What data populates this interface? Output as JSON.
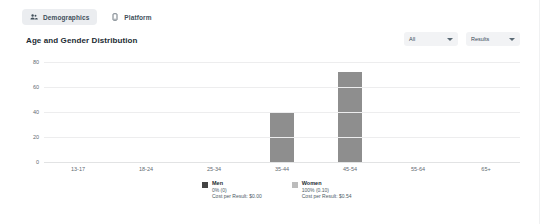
{
  "tabs": [
    {
      "label": "Demographics",
      "icon": "people-icon",
      "active": true
    },
    {
      "label": "Platform",
      "icon": "device-icon",
      "active": false
    }
  ],
  "header": {
    "title": "Age and Gender Distribution",
    "filters": [
      {
        "name": "breakdown-select",
        "value": "All"
      },
      {
        "name": "metric-select",
        "value": "Results"
      }
    ]
  },
  "colors": {
    "bar": "#8e8e8e",
    "men_swatch": "#444444",
    "women_swatch": "#bcbcbc",
    "grid": "#ededee",
    "tab_active_bg": "#ebedf0",
    "select_bg": "#f2f3f5"
  },
  "chart_data": {
    "type": "bar",
    "title": "Age and Gender Distribution",
    "xlabel": "",
    "ylabel": "",
    "ylim": [
      0,
      80
    ],
    "yticks": [
      0,
      20,
      40,
      60,
      80
    ],
    "grid": true,
    "legend_position": "bottom",
    "categories": [
      "13-17",
      "18-24",
      "25-34",
      "35-44",
      "45-54",
      "55-64",
      "65+"
    ],
    "values": [
      0,
      0,
      0,
      40,
      72,
      0,
      0
    ],
    "series": [
      {
        "name": "Total",
        "values": [
          0,
          0,
          0,
          40,
          72,
          0,
          0
        ]
      }
    ],
    "legend": [
      {
        "name": "Men",
        "share": "0% (0)",
        "cost": "Cost per Result: $0.00"
      },
      {
        "name": "Women",
        "share": "100% (0.10)",
        "cost": "Cost per Result: $0.54"
      }
    ]
  }
}
